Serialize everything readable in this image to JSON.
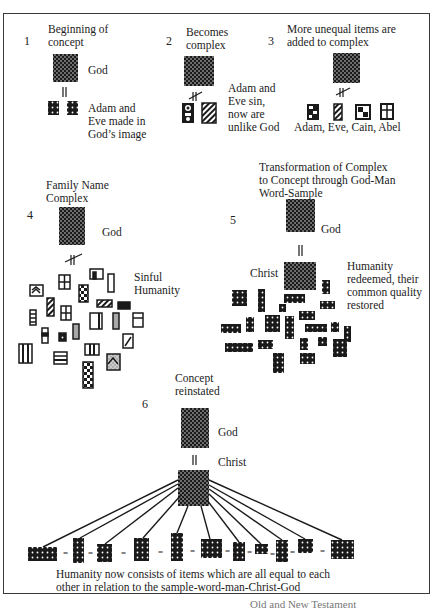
{
  "panels": [
    {
      "number": "1",
      "title_lines": [
        "Beginning of",
        "concept"
      ],
      "top_label": "God",
      "relation": "equal",
      "bottom_label_lines": [
        "Adam and",
        "Eve made in",
        "God’s image"
      ]
    },
    {
      "number": "2",
      "title_lines": [
        "Becomes",
        "complex"
      ],
      "relation": "not-equal",
      "side_label_lines": [
        "Adam and",
        "Eve sin,",
        "now are",
        "unlike God"
      ]
    },
    {
      "number": "3",
      "title_lines": [
        "More unequal items are",
        "added to complex"
      ],
      "relation": "not-equal",
      "item_labels": "Adam,  Eve,  Cain, Abel"
    },
    {
      "number": "4",
      "title_lines": [
        "Family Name",
        "Complex"
      ],
      "top_label": "God",
      "relation": "not-equal",
      "side_label_lines": [
        "Sinful",
        "Humanity"
      ]
    },
    {
      "number": "5",
      "title_lines": [
        "Transformation of Complex",
        "to Concept through God-Man",
        "Word-Sample"
      ],
      "top_label": "God",
      "relation": "equal",
      "middle_label": "Christ",
      "side_label_lines": [
        "Humanity",
        "redeemed, their",
        "common quality",
        "restored"
      ]
    },
    {
      "number": "6",
      "title_lines": [
        "Concept",
        "reinstated"
      ],
      "top_label": "God",
      "relation": "equal",
      "middle_label": "Christ",
      "equal_sign": "=",
      "bottom_caption_lines": [
        "Humanity now consists of  items which are all equal to each",
        "other in relation to the sample-word-man-Christ-God"
      ]
    }
  ],
  "colors": {
    "ink": "#1a1a1a",
    "frame": "#3a3a3a",
    "dot": "#ffffff",
    "gray_fill": "#a8a8a8"
  },
  "cut_caption": "Old and New Testament"
}
